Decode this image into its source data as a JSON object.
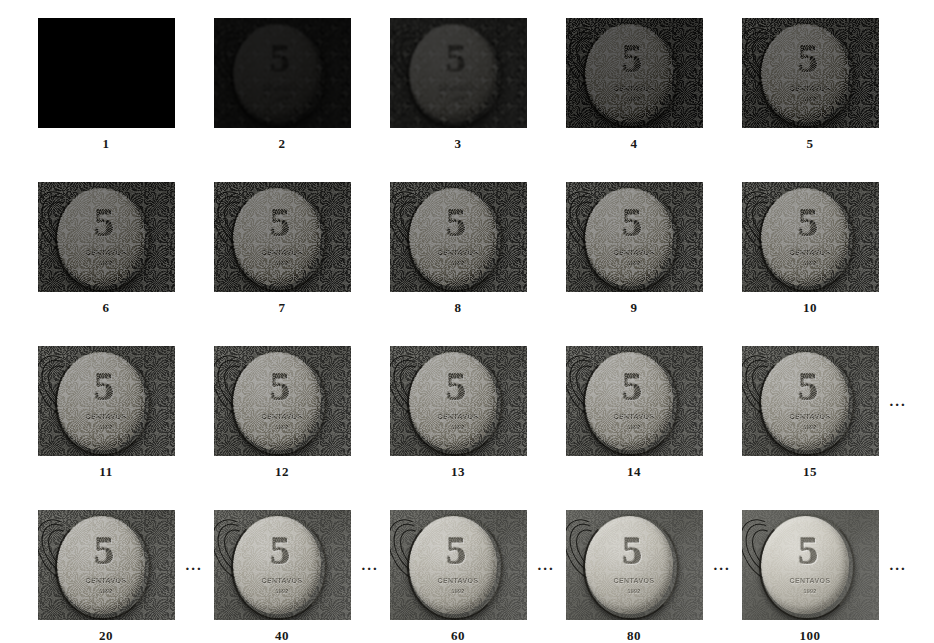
{
  "figure": {
    "background_color": "#ffffff",
    "label_color": "#181818",
    "ellipsis_glyph": "...",
    "coin": {
      "denomination": "5",
      "legend": "CENTAVOS",
      "year": "1992"
    },
    "columns_per_row": 5,
    "rows": [
      {
        "row_name": "iterations-1-to-5",
        "cells": [
          {
            "label": "1",
            "iteration": 1,
            "brightness": 0.0,
            "noise": 0.0,
            "blur": 0.0,
            "trailing_ellipsis": false
          },
          {
            "label": "2",
            "iteration": 2,
            "brightness": 0.13,
            "noise": 1.0,
            "blur": 0.9,
            "trailing_ellipsis": false
          },
          {
            "label": "3",
            "iteration": 3,
            "brightness": 0.27,
            "noise": 0.92,
            "blur": 0.8,
            "trailing_ellipsis": false
          },
          {
            "label": "4",
            "iteration": 4,
            "brightness": 0.37,
            "noise": 0.86,
            "blur": 0.7,
            "trailing_ellipsis": false
          },
          {
            "label": "5",
            "iteration": 5,
            "brightness": 0.45,
            "noise": 0.8,
            "blur": 0.7,
            "trailing_ellipsis": false
          }
        ]
      },
      {
        "row_name": "iterations-6-to-10",
        "cells": [
          {
            "label": "6",
            "iteration": 6,
            "brightness": 0.52,
            "noise": 0.74,
            "blur": 0.6,
            "trailing_ellipsis": false
          },
          {
            "label": "7",
            "iteration": 7,
            "brightness": 0.57,
            "noise": 0.7,
            "blur": 0.6,
            "trailing_ellipsis": false
          },
          {
            "label": "8",
            "iteration": 8,
            "brightness": 0.61,
            "noise": 0.66,
            "blur": 0.5,
            "trailing_ellipsis": false
          },
          {
            "label": "9",
            "iteration": 9,
            "brightness": 0.65,
            "noise": 0.62,
            "blur": 0.5,
            "trailing_ellipsis": false
          },
          {
            "label": "10",
            "iteration": 10,
            "brightness": 0.68,
            "noise": 0.58,
            "blur": 0.5,
            "trailing_ellipsis": false
          }
        ]
      },
      {
        "row_name": "iterations-11-to-15",
        "cells": [
          {
            "label": "11",
            "iteration": 11,
            "brightness": 0.71,
            "noise": 0.54,
            "blur": 0.4,
            "trailing_ellipsis": false
          },
          {
            "label": "12",
            "iteration": 12,
            "brightness": 0.74,
            "noise": 0.51,
            "blur": 0.4,
            "trailing_ellipsis": false
          },
          {
            "label": "13",
            "iteration": 13,
            "brightness": 0.76,
            "noise": 0.48,
            "blur": 0.4,
            "trailing_ellipsis": false
          },
          {
            "label": "14",
            "iteration": 14,
            "brightness": 0.78,
            "noise": 0.45,
            "blur": 0.35,
            "trailing_ellipsis": false
          },
          {
            "label": "15",
            "iteration": 15,
            "brightness": 0.8,
            "noise": 0.42,
            "blur": 0.35,
            "trailing_ellipsis": true
          }
        ]
      },
      {
        "row_name": "iterations-20-to-100",
        "cells": [
          {
            "label": "20",
            "iteration": 20,
            "brightness": 0.84,
            "noise": 0.36,
            "blur": 0.3,
            "trailing_ellipsis": true
          },
          {
            "label": "40",
            "iteration": 40,
            "brightness": 0.9,
            "noise": 0.26,
            "blur": 0.25,
            "trailing_ellipsis": true
          },
          {
            "label": "60",
            "iteration": 60,
            "brightness": 0.93,
            "noise": 0.2,
            "blur": 0.2,
            "trailing_ellipsis": true
          },
          {
            "label": "80",
            "iteration": 80,
            "brightness": 0.96,
            "noise": 0.15,
            "blur": 0.2,
            "trailing_ellipsis": true
          },
          {
            "label": "100",
            "iteration": 100,
            "brightness": 1.0,
            "noise": 0.1,
            "blur": 0.15,
            "trailing_ellipsis": true
          }
        ]
      }
    ]
  }
}
